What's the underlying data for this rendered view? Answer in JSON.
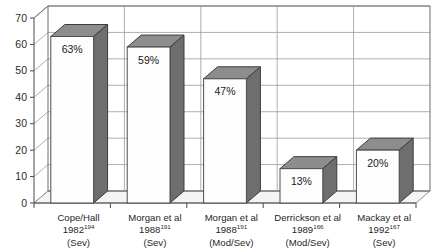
{
  "chart_data": {
    "type": "bar",
    "title": "",
    "xlabel": "",
    "ylabel": "",
    "ylim": [
      0,
      70
    ],
    "ytick_step": 10,
    "yticks": [
      "0",
      "10",
      "20",
      "30",
      "40",
      "50",
      "60",
      "70"
    ],
    "grid": true,
    "legend": "none",
    "style": "3d-column",
    "categories": [
      "Cope/Hall 1982194 (Sev)",
      "Morgan et al 1988191 (Sev)",
      "Morgan et al 1988191 (Mod/Sev)",
      "Derrickson et al 1989166 (Mod/Sev)",
      "Mackay et al 1992167 (Sev)"
    ],
    "values": [
      63,
      59,
      47,
      13,
      20
    ],
    "data_labels": [
      "63%",
      "59%",
      "47%",
      "13%",
      "20%"
    ],
    "points": [
      {
        "author": "Cope/Hall",
        "year": "1982",
        "ref": "194",
        "severity": "(Sev)",
        "value": 63,
        "label": "63%"
      },
      {
        "author": "Morgan et al",
        "year": "1988",
        "ref": "191",
        "severity": "(Sev)",
        "value": 59,
        "label": "59%"
      },
      {
        "author": "Morgan et al",
        "year": "1988",
        "ref": "191",
        "severity": "(Mod/Sev)",
        "value": 47,
        "label": "47%"
      },
      {
        "author": "Derrickson et al",
        "year": "1989",
        "ref": "166",
        "severity": "(Mod/Sev)",
        "value": 13,
        "label": "13%"
      },
      {
        "author": "Mackay et al",
        "year": "1992",
        "ref": "167",
        "severity": "(Sev)",
        "value": 20,
        "label": "20%"
      }
    ],
    "colors": {
      "bar_front": "#fdfdfd",
      "bar_side": "#6e6e6e",
      "bar_top": "#8d8d8d",
      "gridline": "#9a9a9a",
      "frame": "#6d6d6d",
      "text": "#1a1a1a"
    }
  }
}
